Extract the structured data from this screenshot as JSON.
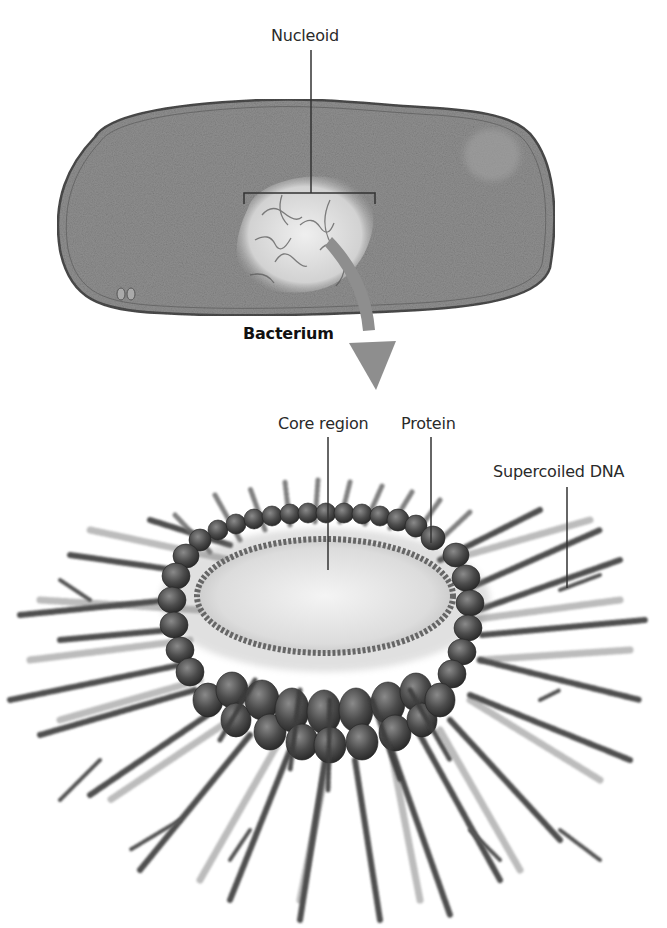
{
  "figure": {
    "top_panel": {
      "name": "bacterium",
      "caption": "Bacterium",
      "labels": {
        "nucleoid": "Nucleoid"
      }
    },
    "bottom_panel": {
      "name": "nucleoid-model",
      "labels": {
        "core_region": "Core region",
        "protein": "Protein",
        "supercoiled_dna": "Supercoiled DNA"
      }
    },
    "arrow": {
      "from": "nucleoid",
      "to": "nucleoid-model",
      "color": "#8e8e8e"
    },
    "colors": {
      "cell_fill": "#8f8f8f",
      "cell_outline": "#4a4a4a",
      "nucleoid_fill": "#d8d8d8",
      "protein": "#4a4a4a",
      "dna_dark": "#4e4e4e",
      "dna_light": "#a8a8a8",
      "core": "#e6e6e6",
      "leader_line": "#333333"
    }
  }
}
